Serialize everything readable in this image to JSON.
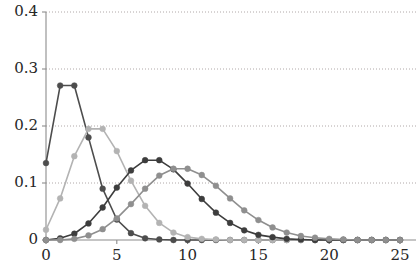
{
  "chart_data": {
    "type": "line",
    "title": "",
    "subtitle": "",
    "xlabel": "",
    "ylabel": "",
    "xlim": [
      0,
      25
    ],
    "ylim": [
      0,
      0.4
    ],
    "grid": true,
    "grid_style": "dotted-horizontal",
    "legend": "none",
    "x": [
      0,
      1,
      2,
      3,
      4,
      5,
      6,
      7,
      8,
      9,
      10,
      11,
      12,
      13,
      14,
      15,
      16,
      17,
      18,
      19,
      20,
      21,
      22,
      23,
      24,
      25
    ],
    "series": [
      {
        "name": "lambda-2",
        "color": "#4d4d4d",
        "marker": "circle",
        "values": [
          0.135,
          0.271,
          0.271,
          0.18,
          0.09,
          0.036,
          0.012,
          0.003,
          0.001,
          0.0,
          0.0,
          0.0,
          0.0,
          0.0,
          0.0,
          0.0,
          0.0,
          0.0,
          0.0,
          0.0,
          0.0,
          0.0,
          0.0,
          0.0,
          0.0,
          0.0
        ]
      },
      {
        "name": "lambda-4",
        "color": "#b3b3b3",
        "marker": "circle",
        "values": [
          0.018,
          0.073,
          0.147,
          0.195,
          0.195,
          0.156,
          0.104,
          0.06,
          0.03,
          0.013,
          0.005,
          0.002,
          0.001,
          0.0,
          0.0,
          0.0,
          0.0,
          0.0,
          0.0,
          0.0,
          0.0,
          0.0,
          0.0,
          0.0,
          0.0,
          0.0
        ]
      },
      {
        "name": "lambda-8",
        "color": "#3d3d3d",
        "marker": "circle",
        "values": [
          0.0,
          0.003,
          0.011,
          0.029,
          0.057,
          0.092,
          0.122,
          0.14,
          0.14,
          0.124,
          0.099,
          0.072,
          0.048,
          0.03,
          0.017,
          0.009,
          0.005,
          0.002,
          0.001,
          0.0,
          0.0,
          0.0,
          0.0,
          0.0,
          0.0,
          0.0
        ]
      },
      {
        "name": "lambda-10",
        "color": "#8f8f8f",
        "marker": "circle",
        "values": [
          0.0,
          0.0,
          0.002,
          0.008,
          0.019,
          0.038,
          0.063,
          0.09,
          0.113,
          0.125,
          0.125,
          0.114,
          0.095,
          0.073,
          0.052,
          0.035,
          0.022,
          0.013,
          0.007,
          0.004,
          0.002,
          0.001,
          0.0,
          0.0,
          0.0,
          0.0
        ]
      }
    ],
    "y_ticks": [
      {
        "value": 0,
        "label": "0"
      },
      {
        "value": 0.1,
        "label": "0.1"
      },
      {
        "value": 0.2,
        "label": "0.2"
      },
      {
        "value": 0.3,
        "label": "0.3"
      },
      {
        "value": 0.4,
        "label": "0.4"
      }
    ],
    "x_ticks": [
      {
        "value": 0,
        "label": "0"
      },
      {
        "value": 5,
        "label": "5"
      },
      {
        "value": 10,
        "label": "10"
      },
      {
        "value": 15,
        "label": "15"
      },
      {
        "value": 20,
        "label": "20"
      },
      {
        "value": 25,
        "label": "25"
      }
    ],
    "axis_color": "#8c8c8c",
    "gridline_color": "#b0a8a8",
    "background_color": "#ffffff"
  }
}
